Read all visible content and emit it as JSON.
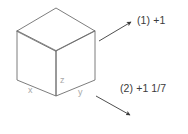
{
  "figure": {
    "background_color": "#ffffff",
    "line_color": "#6e6e6e",
    "arrow_color": "#3a3a3a",
    "label_color": "#a8a8a8",
    "text_color": "#3a3a3a"
  },
  "cube": {
    "axis_labels": {
      "x": "x",
      "y": "y",
      "z": "z"
    }
  },
  "callouts": [
    {
      "id": "1",
      "text": "(1) +1"
    },
    {
      "id": "2",
      "text": "(2) +1 1/7"
    }
  ]
}
